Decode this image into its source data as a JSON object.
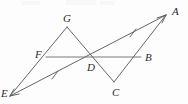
{
  "figure": {
    "kind": "geometry-diagram",
    "stroke_color": "#555555",
    "label_color": "#2b2b2b",
    "background": "#fdfdfd",
    "points": [
      {
        "name": "A",
        "label": "A",
        "x": 168,
        "y": 14,
        "label_x": 172,
        "label_y": 7
      },
      {
        "name": "B",
        "label": "B",
        "x": 141,
        "y": 57,
        "label_x": 145,
        "label_y": 53
      },
      {
        "name": "C",
        "label": "C",
        "x": 114,
        "y": 83,
        "label_x": 112,
        "label_y": 88
      },
      {
        "name": "D",
        "label": "D",
        "x": 92,
        "y": 57,
        "label_x": 88,
        "label_y": 63
      },
      {
        "name": "E",
        "label": "E",
        "x": 8,
        "y": 97,
        "label_x": 2,
        "label_y": 90
      },
      {
        "name": "F",
        "label": "F",
        "x": 46,
        "y": 56,
        "label_x": 36,
        "label_y": 51
      },
      {
        "name": "G",
        "label": "G",
        "x": 67,
        "y": 26,
        "label_x": 64,
        "label_y": 15
      }
    ],
    "segments": [
      {
        "name": "ray-E-to-A",
        "from": "E",
        "to": "A",
        "arrow_start": true,
        "arrow_end": true,
        "tick_marks": 2
      },
      {
        "name": "segment-F-to-B",
        "from": "F",
        "to": "B",
        "arrow_start": false,
        "arrow_end": false,
        "tick_marks": 0
      },
      {
        "name": "segment-G-to-E",
        "from": "G",
        "to": "E",
        "arrow_start": false,
        "arrow_end": false,
        "tick_marks": 0
      },
      {
        "name": "segment-G-to-C",
        "from": "G",
        "to": "C",
        "arrow_start": false,
        "arrow_end": false,
        "tick_marks": 0
      },
      {
        "name": "segment-C-to-A",
        "from": "C",
        "to": "A",
        "arrow_start": false,
        "arrow_end": false,
        "tick_marks": 0
      }
    ],
    "tick_positions": [
      {
        "name": "tick-on-ED",
        "x": 55,
        "y": 76
      },
      {
        "name": "tick-on-DA",
        "x": 133,
        "y": 33
      }
    ]
  }
}
